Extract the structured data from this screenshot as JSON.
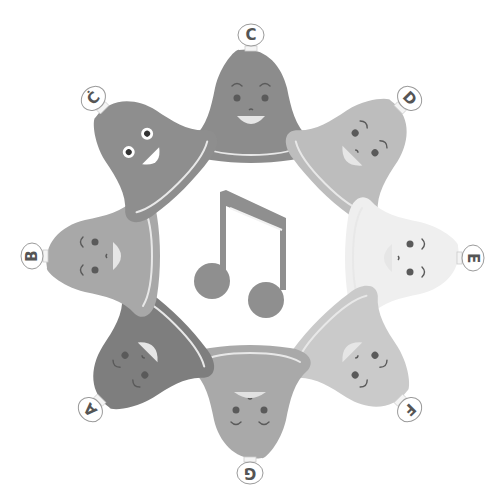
{
  "illustration": {
    "title": "Handbell circle with music note",
    "center_icon": "beamed-eighth-notes-icon",
    "note_color": "#8f8f8f",
    "bells": [
      {
        "id": "c",
        "label": "C",
        "angle": 0,
        "cx": 251,
        "cy": 108,
        "color": "#8c8c8c",
        "face": "happy-open-mouth"
      },
      {
        "id": "d",
        "label": "D",
        "angle": 45,
        "cx": 358,
        "cy": 150,
        "color": "#bdbdbd",
        "face": "smile"
      },
      {
        "id": "e",
        "label": "E",
        "angle": 90,
        "cx": 400,
        "cy": 258,
        "color": "#efefef",
        "face": "smile"
      },
      {
        "id": "f",
        "label": "F",
        "angle": 135,
        "cx": 358,
        "cy": 358,
        "color": "#cacaca",
        "face": "smile"
      },
      {
        "id": "g",
        "label": "G",
        "angle": 180,
        "cx": 250,
        "cy": 400,
        "color": "#a9a9a9",
        "face": "content"
      },
      {
        "id": "a",
        "label": "A",
        "angle": 225,
        "cx": 142,
        "cy": 358,
        "color": "#7e7e7e",
        "face": "smile"
      },
      {
        "id": "b",
        "label": "B",
        "angle": 270,
        "cx": 105,
        "cy": 256,
        "color": "#a8a8a8",
        "face": "smile"
      },
      {
        "id": "c-high",
        "label": "Ċ",
        "angle": -45,
        "cx": 145,
        "cy": 150,
        "color": "#8e8e8e",
        "face": "googly-eyes"
      }
    ]
  }
}
